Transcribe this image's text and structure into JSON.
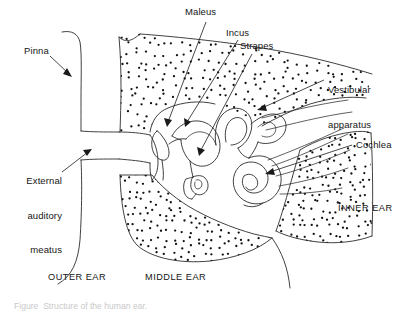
{
  "figure": {
    "background_color": "#ffffff",
    "line_color": "#2b2b2b",
    "stipple_color": "#111111"
  },
  "labels": {
    "malleus": "Maleus",
    "incus": "Incus",
    "stapes": "Strapes",
    "pinna": "Pinna",
    "external_auditory_meatus_line1": "External",
    "external_auditory_meatus_line2": "auditory",
    "external_auditory_meatus_line3": "meatus",
    "vestibular_line1": "Vestibular",
    "vestibular_line2": "apparatus",
    "cochlea": "Cochlea"
  },
  "regions": {
    "outer_ear": "OUTER EAR",
    "middle_ear": "MIDDLE EAR",
    "inner_ear": "INNER EAR"
  },
  "caption": {
    "partial_text": "Figure  Structure of the human ear."
  },
  "stipple": {
    "upper_bone_dot_count": 330,
    "lower_bone_dot_count": 250,
    "inner_bone_dot_count": 210,
    "dot_radius": 1.15
  },
  "chart_data": {
    "type": "diagram",
    "parts_labelled": [
      "Pinna",
      "External auditory meatus",
      "Maleus",
      "Incus",
      "Strapes",
      "Vestibular apparatus",
      "Cochlea"
    ],
    "region_divisions": [
      "OUTER EAR",
      "MIDDLE EAR",
      "INNER EAR"
    ]
  }
}
